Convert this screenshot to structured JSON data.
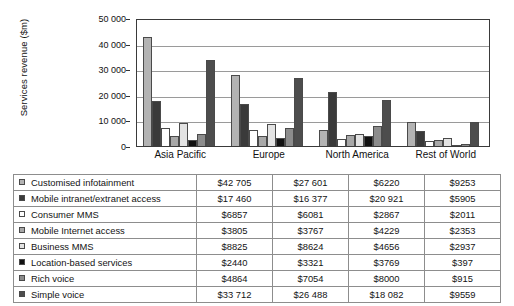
{
  "chart_data": {
    "type": "bar",
    "title": "",
    "xlabel": "",
    "ylabel": "Services revenue ($m)",
    "ylim": [
      0,
      50000
    ],
    "yticks": [
      0,
      10000,
      20000,
      30000,
      40000,
      50000
    ],
    "ytick_labels": [
      "0",
      "10 000",
      "20 000",
      "30 000",
      "40 000",
      "50 000"
    ],
    "grid": true,
    "legend_position": "table-below",
    "categories": [
      "Asia Pacific",
      "Europe",
      "North America",
      "Rest of World"
    ],
    "series": [
      {
        "name": "Customised infotainment",
        "color": "#b3b3b3",
        "values": [
          42705,
          27601,
          6220,
          9253
        ],
        "display_values": [
          "$42 705",
          "$27 601",
          "$6220",
          "$9253"
        ]
      },
      {
        "name": "Mobile intranet/extranet access",
        "color": "#3a3a3a",
        "values": [
          17460,
          16377,
          20921,
          5905
        ],
        "display_values": [
          "$17 460",
          "$16 377",
          "$20 921",
          "$5905"
        ]
      },
      {
        "name": "Consumer MMS",
        "color": "#ffffff",
        "values": [
          6857,
          6081,
          2867,
          2011
        ],
        "display_values": [
          "$6857",
          "$6081",
          "$2867",
          "$2011"
        ]
      },
      {
        "name": "Mobile Internet access",
        "color": "#a8a8a8",
        "values": [
          3805,
          3767,
          4229,
          2353
        ],
        "display_values": [
          "$3805",
          "$3767",
          "$4229",
          "$2353"
        ]
      },
      {
        "name": "Business MMS",
        "color": "#e3e3e3",
        "values": [
          8825,
          8624,
          4656,
          2937
        ],
        "display_values": [
          "$8825",
          "$8624",
          "$4656",
          "$2937"
        ]
      },
      {
        "name": "Location-based services",
        "color": "#111111",
        "values": [
          2440,
          3321,
          3769,
          397
        ],
        "display_values": [
          "$2440",
          "$3321",
          "$3769",
          "$397"
        ]
      },
      {
        "name": "Rich voice",
        "color": "#8c8c8c",
        "values": [
          4864,
          7054,
          8000,
          915
        ],
        "display_values": [
          "$4864",
          "$7054",
          "$8000",
          "$915"
        ]
      },
      {
        "name": "Simple voice",
        "color": "#4d4d4d",
        "values": [
          33712,
          26488,
          18082,
          9559
        ],
        "display_values": [
          "$33 712",
          "$26 488",
          "$18 082",
          "$9559"
        ]
      }
    ]
  }
}
